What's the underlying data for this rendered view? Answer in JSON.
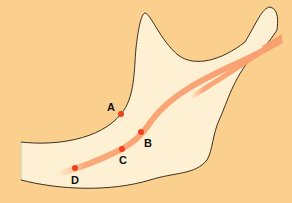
{
  "diagram": {
    "title": "",
    "colors": {
      "background": "#FBD08F",
      "bone_fill": "#FEF1D3",
      "outline": "#3a3020",
      "nerve": "#F9A070",
      "point": "#F0421E",
      "label": "#111111"
    },
    "points": [
      {
        "id": "A",
        "label": "A",
        "x": 121,
        "y": 114,
        "label_x": 112,
        "label_y": 108
      },
      {
        "id": "B",
        "label": "B",
        "x": 141,
        "y": 132,
        "label_x": 148,
        "label_y": 144
      },
      {
        "id": "C",
        "label": "C",
        "x": 122,
        "y": 149,
        "label_x": 125,
        "label_y": 165
      },
      {
        "id": "D",
        "label": "D",
        "x": 75,
        "y": 168,
        "label_x": 76,
        "label_y": 185
      }
    ]
  }
}
